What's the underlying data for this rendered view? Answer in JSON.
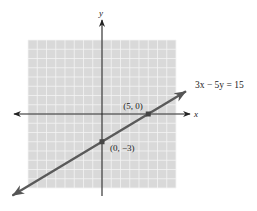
{
  "chart_data": {
    "type": "line",
    "title": "",
    "xlabel": "x",
    "ylabel": "y",
    "xlim": [
      -8,
      8
    ],
    "ylim": [
      -8,
      8
    ],
    "grid": true,
    "series": [
      {
        "name": "3x − 5y = 15",
        "equation": "3x − 5y = 15",
        "slope": 0.6,
        "intercept": -3,
        "x_range": [
          -9.6,
          9
        ]
      }
    ],
    "points": [
      {
        "x": 5,
        "y": 0,
        "label": "(5, 0)"
      },
      {
        "x": 0,
        "y": -3,
        "label": "(0, −3)"
      }
    ],
    "colors": {
      "grid_background": "#d9d9d9",
      "grid_lines": "#f4f4f4",
      "axes": "#333333",
      "line": "#5a5a5a",
      "points": "#444444"
    }
  }
}
